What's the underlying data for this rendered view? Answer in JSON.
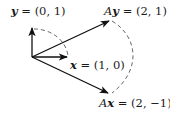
{
  "diagram": {
    "vectors": [
      {
        "id": "y",
        "label_prefix": "",
        "label_var": "y",
        "label_value": " = (0, 1)",
        "coords": [
          0,
          1
        ]
      },
      {
        "id": "x",
        "label_prefix": "",
        "label_var": "x",
        "label_value": " = (1, 0)",
        "coords": [
          1,
          0
        ]
      },
      {
        "id": "Ay",
        "label_prefix": "A",
        "label_var": "y",
        "label_value": " = (2, 1)",
        "coords": [
          2,
          1
        ]
      },
      {
        "id": "Ax",
        "label_prefix": "A",
        "label_var": "x",
        "label_value": " = (2, −1)",
        "coords": [
          2,
          -1
        ]
      }
    ],
    "arcs": [
      {
        "from": "y",
        "to": "x",
        "style": "dashed"
      },
      {
        "from": "Ay",
        "to": "Ax",
        "style": "dashed"
      }
    ]
  }
}
